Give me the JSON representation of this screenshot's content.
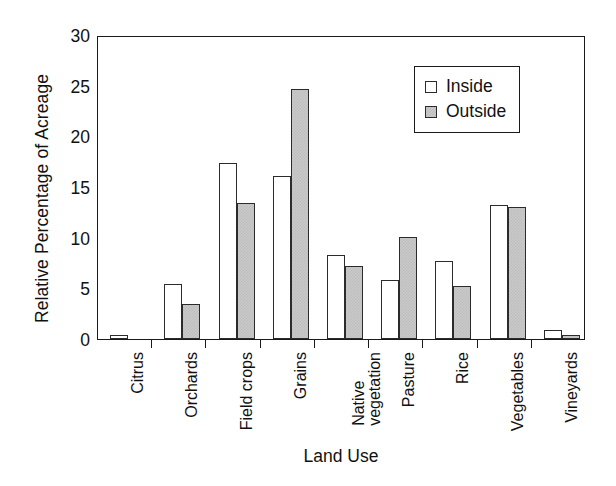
{
  "chart_data": {
    "type": "bar",
    "title": "",
    "xlabel": "Land Use",
    "ylabel": "Relative Percentage of Acreage",
    "ylim": [
      0,
      30
    ],
    "yticks": [
      0,
      5,
      10,
      15,
      20,
      25,
      30
    ],
    "grid": false,
    "legend_position": "top-right",
    "categories": [
      "Citrus",
      "Orchards",
      "Field crops",
      "Grains",
      "Native vegetation",
      "Pasture",
      "Rice",
      "Vegetables",
      "Vineyards"
    ],
    "series": [
      {
        "name": "Inside",
        "fill": "#ffffff",
        "values": [
          0.4,
          5.4,
          17.4,
          16.1,
          8.3,
          5.8,
          7.7,
          13.2,
          0.9
        ]
      },
      {
        "name": "Outside",
        "fill": "#c9c9c9",
        "values": [
          0.0,
          3.5,
          13.4,
          24.7,
          7.2,
          10.1,
          5.2,
          13.0,
          0.4
        ]
      }
    ]
  },
  "axes": {
    "y_title": "Relative Percentage of Acreage",
    "x_title": "Land Use",
    "y_tick_labels": [
      "0",
      "5",
      "10",
      "15",
      "20",
      "25",
      "30"
    ]
  },
  "legend": {
    "entries": [
      {
        "label": "Inside",
        "swatch": "open-square-swatch"
      },
      {
        "label": "Outside",
        "swatch": "filled-square-swatch"
      }
    ]
  },
  "category_labels": [
    {
      "line1": "Citrus",
      "line2": ""
    },
    {
      "line1": "Orchards",
      "line2": ""
    },
    {
      "line1": "Field crops",
      "line2": ""
    },
    {
      "line1": "Grains",
      "line2": ""
    },
    {
      "line1": "Native",
      "line2": "vegetation"
    },
    {
      "line1": "Pasture",
      "line2": ""
    },
    {
      "line1": "Rice",
      "line2": ""
    },
    {
      "line1": "Vegetables",
      "line2": ""
    },
    {
      "line1": "Vineyards",
      "line2": ""
    }
  ]
}
